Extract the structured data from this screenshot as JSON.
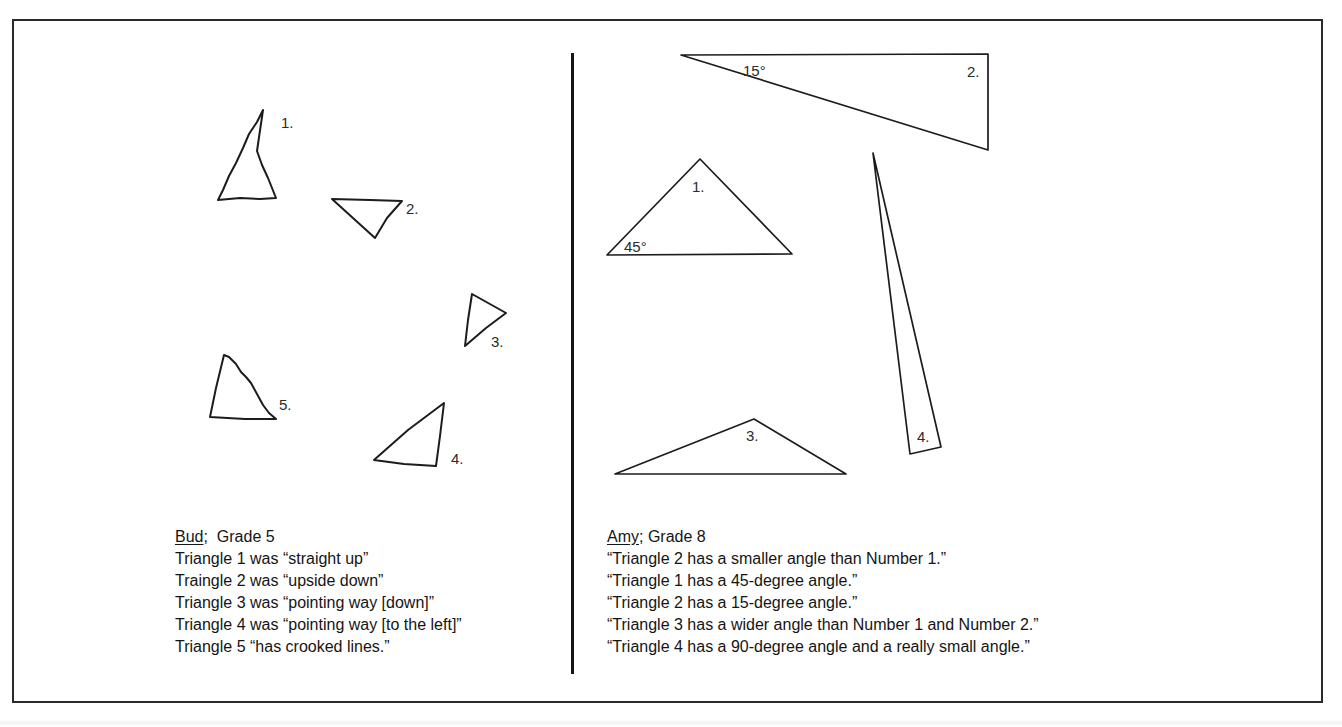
{
  "figure": {
    "left_panel": {
      "student": "Bud",
      "separator": ";",
      "grade": "Grade 5",
      "triangle_labels": [
        "1.",
        "2.",
        "3.",
        "4.",
        "5."
      ],
      "descriptions": [
        "Triangle 1 was “straight up”",
        "Traingle 2 was “upside down”",
        "Triangle 3 was “pointing way [down]”",
        "Triangle 4 was “pointing way [to the left]”",
        "Triangle 5 “has crooked lines.”"
      ]
    },
    "right_panel": {
      "student": "Amy",
      "separator": ";",
      "grade": "Grade 8",
      "triangle_labels": [
        "1.",
        "2.",
        "3.",
        "4."
      ],
      "angle_labels": {
        "triangle_1": "45°",
        "triangle_2": "15°"
      },
      "descriptions": [
        "“Triangle 2 has a smaller angle than Number 1.”",
        "“Triangle 1 has a 45-degree angle.”",
        "“Triangle 2 has a 15-degree angle.”",
        "“Triangle 3 has a wider angle than Number 1 and Number 2.”",
        "“Triangle 4 has a 90-degree angle and a really small angle.”"
      ]
    }
  },
  "colors": {
    "ink": "#1c1c1c",
    "paper": "#ffffff"
  }
}
